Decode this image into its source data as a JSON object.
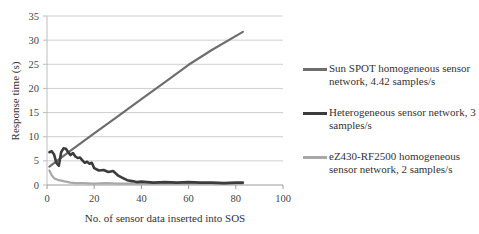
{
  "chart_data": {
    "type": "line",
    "title": "",
    "xlabel": "No. of sensor data inserted into SOS",
    "ylabel": "Response time (s)",
    "xlim": [
      0,
      100
    ],
    "ylim": [
      0,
      35
    ],
    "xticks": [
      0,
      20,
      40,
      60,
      80,
      100
    ],
    "yticks": [
      0,
      5,
      10,
      15,
      20,
      25,
      30,
      35
    ],
    "grid": "horizontal",
    "legend_position": "right",
    "series": [
      {
        "name": "Sun SPOT homogeneous sensor network, 4.42 samples/s",
        "color": "#6e6e6e",
        "width": 2.2,
        "x": [
          1,
          10,
          20,
          30,
          40,
          50,
          60,
          70,
          83
        ],
        "y": [
          3.8,
          7.1,
          10.7,
          14.2,
          17.8,
          21.3,
          24.9,
          28.0,
          31.7
        ]
      },
      {
        "name": "Heterogeneous sensor network, 3 samples/s",
        "color": "#3c3c3c",
        "width": 2.6,
        "x": [
          1,
          2,
          3,
          4,
          5,
          6,
          7,
          8,
          9,
          10,
          11,
          12,
          13,
          14,
          15,
          16,
          17,
          18,
          19,
          20,
          22,
          24,
          26,
          28,
          30,
          32,
          34,
          36,
          38,
          40,
          45,
          50,
          55,
          60,
          65,
          70,
          75,
          80,
          83
        ],
        "y": [
          6.8,
          7.0,
          6.3,
          4.6,
          4.0,
          6.8,
          7.6,
          7.5,
          6.8,
          6.2,
          6.6,
          5.9,
          5.6,
          5.7,
          5.1,
          4.6,
          4.8,
          4.4,
          4.6,
          3.5,
          3.0,
          3.1,
          2.7,
          2.9,
          2.0,
          1.5,
          1.0,
          0.8,
          0.6,
          0.7,
          0.5,
          0.6,
          0.5,
          0.6,
          0.5,
          0.5,
          0.4,
          0.5,
          0.5
        ]
      },
      {
        "name": "eZ430-RF2500 homogeneous sensor network, 2 samples/s",
        "color": "#a8a8a8",
        "width": 2.2,
        "x": [
          1,
          2,
          3,
          4,
          5,
          6,
          8,
          10,
          12,
          15,
          20,
          25,
          30,
          40,
          50,
          60,
          70,
          80,
          83
        ],
        "y": [
          3.0,
          2.0,
          1.4,
          1.2,
          1.0,
          0.9,
          0.7,
          0.5,
          0.4,
          0.4,
          0.3,
          0.4,
          0.3,
          0.3,
          0.3,
          0.3,
          0.3,
          0.3,
          0.3
        ]
      }
    ]
  }
}
